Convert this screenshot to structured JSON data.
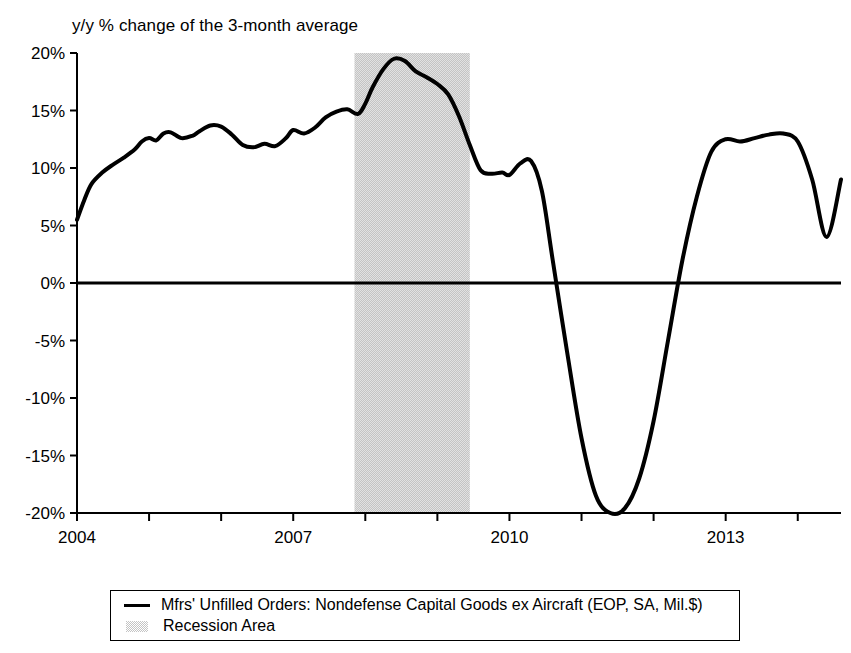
{
  "chart_data": {
    "type": "line",
    "title": "y/y % change of the 3-month average",
    "xlabel": "",
    "ylabel": "",
    "ylim": [
      -20,
      20
    ],
    "xlim": [
      2004,
      2014.6
    ],
    "grid": false,
    "legend_position": "bottom",
    "y_ticks": [
      "20%",
      "15%",
      "10%",
      "5%",
      "0%",
      "-5%",
      "-10%",
      "-15%",
      "-20%"
    ],
    "y_tick_values": [
      20,
      15,
      10,
      5,
      0,
      -5,
      -10,
      -15,
      -20
    ],
    "x_ticks": [
      "2004",
      "2007",
      "2010",
      "2013"
    ],
    "x_tick_values": [
      2004,
      2007,
      2010,
      2013
    ],
    "x_minor_tick_values": [
      2005,
      2006,
      2008,
      2009,
      2011,
      2012,
      2014
    ],
    "zero_line": 0,
    "series": [
      {
        "name": "Mfrs' Unfilled Orders: Nondefense Capital Goods ex Aircraft (EOP, SA, Mil.$)",
        "color": "#000000",
        "x": [
          2004.0,
          2004.1,
          2004.2,
          2004.35,
          2004.5,
          2004.65,
          2004.8,
          2004.9,
          2005.0,
          2005.1,
          2005.2,
          2005.3,
          2005.45,
          2005.6,
          2005.7,
          2005.85,
          2006.0,
          2006.15,
          2006.3,
          2006.45,
          2006.6,
          2006.75,
          2006.9,
          2007.0,
          2007.15,
          2007.3,
          2007.45,
          2007.6,
          2007.75,
          2007.9,
          2008.0,
          2008.1,
          2008.25,
          2008.4,
          2008.55,
          2008.7,
          2008.85,
          2009.0,
          2009.15,
          2009.3,
          2009.45,
          2009.6,
          2009.75,
          2009.9,
          2010.0,
          2010.15,
          2010.3,
          2010.45,
          2010.6,
          2010.8,
          2011.0,
          2011.2,
          2011.4,
          2011.6,
          2011.8,
          2012.0,
          2012.2,
          2012.4,
          2012.6,
          2012.8,
          2013.0,
          2013.2,
          2013.4,
          2013.6,
          2013.8,
          2014.0,
          2014.2,
          2014.4,
          2014.6
        ],
        "values": [
          5.5,
          7.2,
          8.6,
          9.6,
          10.3,
          10.9,
          11.6,
          12.3,
          12.6,
          12.4,
          13.0,
          13.1,
          12.6,
          12.8,
          13.2,
          13.7,
          13.6,
          12.9,
          12.0,
          11.8,
          12.1,
          11.9,
          12.6,
          13.3,
          13.0,
          13.5,
          14.4,
          14.9,
          15.1,
          14.7,
          15.6,
          17.0,
          18.6,
          19.5,
          19.3,
          18.4,
          17.9,
          17.3,
          16.4,
          14.5,
          12.0,
          9.8,
          9.5,
          9.6,
          9.4,
          10.4,
          10.6,
          8.0,
          2.0,
          -6.0,
          -13.5,
          -18.5,
          -20.0,
          -19.6,
          -17.0,
          -12.0,
          -5.0,
          2.0,
          7.5,
          11.4,
          12.5,
          12.3,
          12.6,
          12.9,
          13.0,
          12.3,
          9.0,
          4.0,
          9.0
        ]
      }
    ],
    "annotations": [
      {
        "type": "shaded_band",
        "label": "Recession Area",
        "x_start": 2007.85,
        "x_end": 2009.45,
        "color": "#c4c4c4"
      }
    ],
    "legend": [
      {
        "label": "Mfrs' Unfilled Orders: Nondefense Capital Goods ex Aircraft (EOP, SA, Mil.$)",
        "marker": "line",
        "color": "#000000"
      },
      {
        "label": "Recession Area",
        "marker": "area",
        "color": "#c4c4c4"
      }
    ]
  }
}
